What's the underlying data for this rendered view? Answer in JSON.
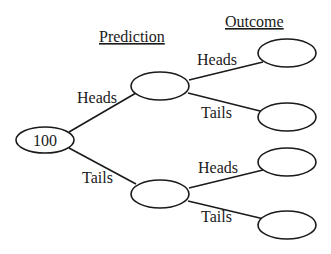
{
  "headers": {
    "prediction": "Prediction",
    "outcome": "Outcome"
  },
  "root": {
    "label": "100"
  },
  "prediction_nodes": [
    {
      "id": "pred-heads",
      "label": ""
    },
    {
      "id": "pred-tails",
      "label": ""
    }
  ],
  "outcome_nodes": [
    {
      "id": "heads-heads",
      "label": ""
    },
    {
      "id": "heads-tails",
      "label": ""
    },
    {
      "id": "tails-heads",
      "label": ""
    },
    {
      "id": "tails-tails",
      "label": ""
    }
  ],
  "edges": {
    "root_to_pred_heads": "Heads",
    "root_to_pred_tails": "Tails",
    "pred_heads_to_heads": "Heads",
    "pred_heads_to_tails": "Tails",
    "pred_tails_to_heads": "Heads",
    "pred_tails_to_tails": "Tails"
  },
  "colors": {
    "stroke": "#1a1a1a",
    "background": "#ffffff"
  }
}
